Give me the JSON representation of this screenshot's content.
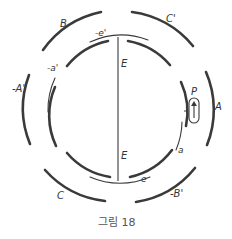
{
  "figure": {
    "caption": "그림 18",
    "labels": {
      "outer_top_left": "B",
      "outer_top_right": "C'",
      "outer_left": "-A'",
      "outer_right": "A",
      "outer_bottom_left": "C",
      "outer_bottom_right": "-B'",
      "inner_top": "-e'",
      "inner_left": "-a'",
      "inner_bottom": "e",
      "inner_right": "a",
      "axis_upper": "E",
      "axis_lower": "E",
      "coil": "P"
    },
    "colors": {
      "stroke": "#3a3a3a",
      "text": "#333333",
      "caption": "#555555"
    }
  }
}
